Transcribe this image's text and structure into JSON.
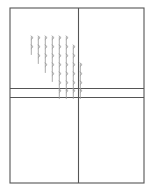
{
  "figure": {
    "background_color": "#ffffff",
    "line_color": "#555555",
    "mark_color": "#9a9a9a",
    "canvas": {
      "width": 154,
      "height": 194
    },
    "frame": {
      "name": "outer-frame",
      "x": 10,
      "y": 8,
      "width": 134,
      "height": 175,
      "stroke_width": 1.1
    },
    "divider_vertical": {
      "name": "vertical-divider",
      "x": 78.5,
      "y1": 8,
      "y2": 183,
      "stroke_width": 1.1
    },
    "band": {
      "name": "horizontal-band",
      "top_y": 88.5,
      "bottom_y": 97.5,
      "x1": 10,
      "x2": 144,
      "stroke_width": 1.1
    },
    "quadrants": [
      {
        "name": "quadrant-top-left",
        "label": ""
      },
      {
        "name": "quadrant-top-right",
        "label": ""
      },
      {
        "name": "quadrant-bottom-left",
        "label": ""
      },
      {
        "name": "quadrant-bottom-right",
        "label": ""
      }
    ],
    "marks": {
      "glyph": "hatch-tick",
      "stroke_width": 0.85,
      "color": "#9a9a9a",
      "height": 9.5,
      "column_x": [
        31,
        38,
        45,
        52,
        59,
        66,
        73,
        80
      ],
      "rows": [
        {
          "y": 36,
          "columns": [
            0,
            1,
            2,
            3,
            4,
            5
          ]
        },
        {
          "y": 45,
          "columns": [
            0,
            1,
            2,
            3,
            4,
            5,
            6
          ]
        },
        {
          "y": 54,
          "columns": [
            1,
            2,
            3,
            4,
            5,
            6
          ]
        },
        {
          "y": 63,
          "columns": [
            2,
            3,
            4,
            5,
            6,
            7
          ]
        },
        {
          "y": 72,
          "columns": [
            3,
            4,
            5,
            6,
            7
          ]
        },
        {
          "y": 81,
          "columns": [
            4,
            5,
            6,
            7
          ]
        },
        {
          "y": 89,
          "columns": [
            4,
            5,
            6,
            7
          ]
        }
      ]
    }
  }
}
